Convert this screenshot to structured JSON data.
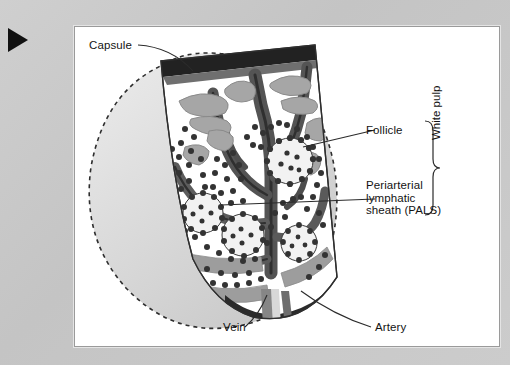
{
  "figure": {
    "play_icon": "play-triangle-icon"
  },
  "labels": {
    "capsule": "Capsule",
    "follicle": "Follicle",
    "pals_line1": "Periarterial",
    "pals_line2": "lymphatic",
    "pals_line3": "sheath (PALS)",
    "white_pulp": "White pulp",
    "vein": "Vein",
    "artery": "Artery"
  },
  "colors": {
    "panel_background": "#ffffff",
    "page_background": "#c9c9c9",
    "capsule_dark": "#232323",
    "vessel_dark": "#4b4b4b",
    "vessel_mid": "#7f7f7f",
    "vessel_light": "#a9a9a9",
    "pulp_fill": "#ffffff",
    "spleen_body": "#d2d2d2",
    "cell_dot": "#3a3a3a",
    "leader_line": "#2b2b2b"
  }
}
